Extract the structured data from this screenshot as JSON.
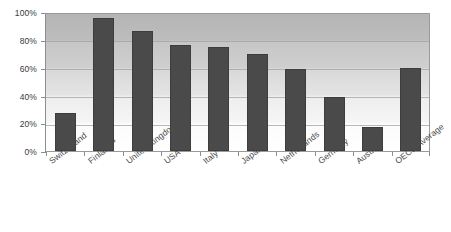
{
  "chart_data": {
    "type": "bar",
    "title": "",
    "subtitle": "",
    "xlabel": "",
    "ylabel": "",
    "categories": [
      "Switzerland",
      "Finland *",
      "United Kingdom",
      "USA",
      "Italy",
      "Japan",
      "Netherlands",
      "Germany",
      "Austria",
      "OECD Average"
    ],
    "values": [
      27,
      96,
      86,
      76,
      75,
      70,
      59,
      39,
      17,
      60
    ],
    "value_unit": "%",
    "ylim": [
      0,
      100
    ],
    "ytick_labels": [
      "0%",
      "20%",
      "40%",
      "60%",
      "80%",
      "100%"
    ],
    "ytick_values": [
      0,
      20,
      40,
      60,
      80,
      100
    ],
    "grid": true,
    "legend": false,
    "legend_position": "none",
    "series": [
      {
        "name": "",
        "values": [
          27,
          96,
          86,
          76,
          75,
          70,
          59,
          39,
          17,
          60
        ]
      }
    ],
    "annotations": [
      "* Finland label carries an asterisk footnote marker"
    ]
  },
  "style": {
    "bar_color": "#4a4a4a",
    "bar_border_color": "#3d3d3d",
    "axis_color": "#8d8d8d",
    "grid_color": "#a2a2a2",
    "plot_background_top": "#b5b5b5",
    "plot_background_bottom": "#ffffff",
    "page_background": "#ffffff",
    "label_color": "#4a4a4a"
  }
}
